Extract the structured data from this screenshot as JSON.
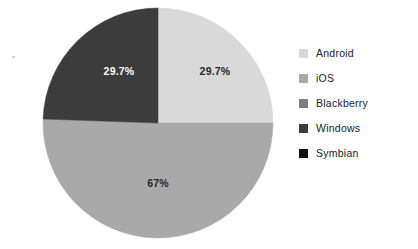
{
  "chart_data": {
    "type": "pie",
    "title": "",
    "subtitle": "",
    "xlabel": "",
    "ylabel": "",
    "grid": false,
    "legend_position": "right",
    "categories": [
      "Android",
      "iOS",
      "Blackberry",
      "Windows",
      "Symbian"
    ],
    "values": [
      29.7,
      67,
      0,
      29.7,
      0
    ],
    "value_labels": [
      "29.7%",
      "67%",
      "",
      "29.7%",
      ""
    ],
    "colors": [
      "#d9d9d9",
      "#a9a9a9",
      "#7d7d7d",
      "#3c3c3c",
      "#111111"
    ],
    "slices": [
      {
        "name": "Android",
        "label": "29.7%",
        "value": 29.7,
        "color": "#d9d9d9",
        "label_color": "#262626",
        "start_angle_deg": 270,
        "end_angle_deg": 360,
        "label_x": 215,
        "label_y": 71
      },
      {
        "name": "iOS",
        "label": "67%",
        "value": 67,
        "color": "#a9a9a9",
        "label_color": "#262626",
        "start_angle_deg": 0,
        "end_angle_deg": 182,
        "label_x": 158,
        "label_y": 183
      },
      {
        "name": "Blackberry",
        "label": "",
        "value": 0,
        "color": "#7d7d7d",
        "label_color": "#262626",
        "start_angle_deg": 182,
        "end_angle_deg": 182,
        "label_x": 0,
        "label_y": 0
      },
      {
        "name": "Windows",
        "label": "29.7%",
        "value": 29.7,
        "color": "#3c3c3c",
        "label_color": "#ffffff",
        "start_angle_deg": 182,
        "end_angle_deg": 270,
        "label_x": 119,
        "label_y": 71
      },
      {
        "name": "Symbian",
        "label": "",
        "value": 0,
        "color": "#111111",
        "label_color": "#262626",
        "start_angle_deg": 270,
        "end_angle_deg": 270,
        "label_x": 0,
        "label_y": 0
      }
    ],
    "geometry": {
      "center_x": 158,
      "center_y": 123,
      "radius": 115
    }
  },
  "legend": {
    "items": [
      {
        "label": "Android",
        "color": "#d9d9d9"
      },
      {
        "label": "iOS",
        "color": "#a9a9a9"
      },
      {
        "label": "Blackberry",
        "color": "#7d7d7d"
      },
      {
        "label": "Windows",
        "color": "#3c3c3c"
      },
      {
        "label": "Symbian",
        "color": "#111111"
      }
    ]
  },
  "background_color": "#ffffff"
}
